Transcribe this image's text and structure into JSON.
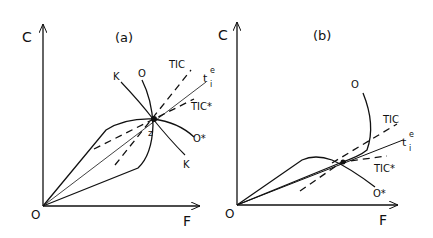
{
  "figure": {
    "panels": [
      {
        "id": "a",
        "title": "(a)",
        "axes": {
          "y_label": "C",
          "x_label": "F",
          "origin_label": "O"
        },
        "curve_labels": {
          "tic": "TIC",
          "tic_star": "TIC*",
          "te": "t",
          "te_sup": "e",
          "te_sub": "i",
          "o": "O",
          "o_star": "O*",
          "k_top": "K",
          "k_bottom": "K",
          "z": "z"
        }
      },
      {
        "id": "b",
        "title": "(b)",
        "axes": {
          "y_label": "C",
          "x_label": "F",
          "origin_label": "O"
        },
        "curve_labels": {
          "tic": "TIC",
          "tic_star": "TIC*",
          "te": "t",
          "te_sup": "e",
          "te_sub": "i",
          "o": "O",
          "o_star": "O*"
        }
      }
    ],
    "colors": {
      "ink": "#111111",
      "background": "#ffffff"
    }
  }
}
